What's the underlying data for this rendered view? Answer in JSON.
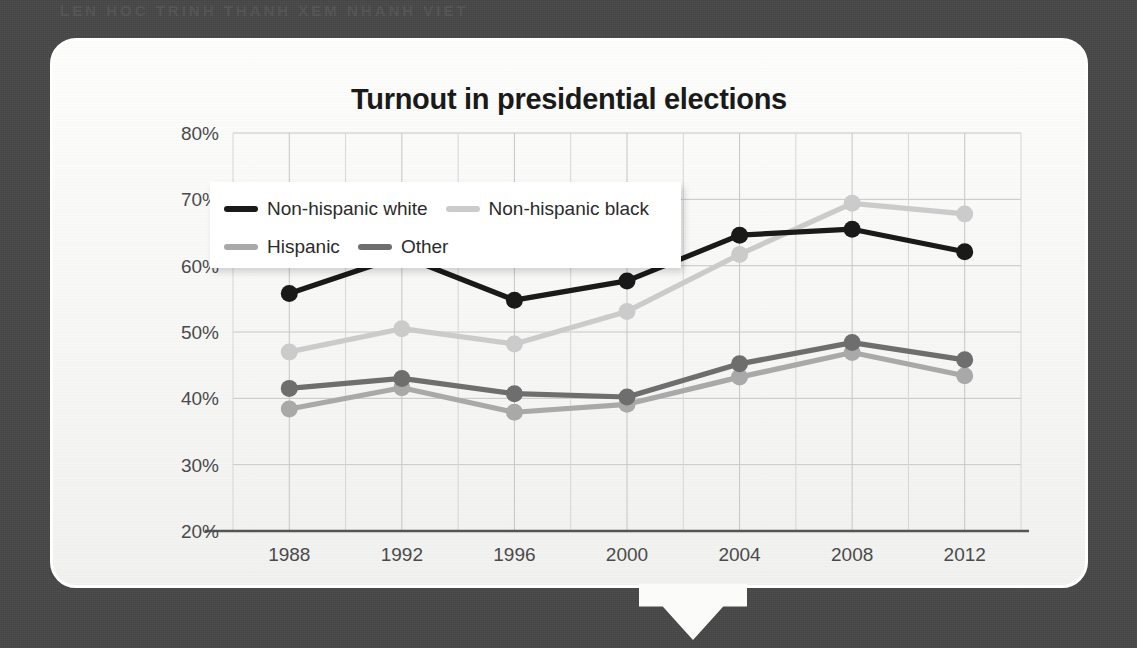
{
  "backdrop": {
    "ghost_text_top": "LEN HOC TRINH THANH  XEM NHANH  VIET",
    "ghost_text_bottom": "THONG KE CU TRI",
    "color": "#474747"
  },
  "panel": {
    "background": "#fbfbfa",
    "border_color": "#ffffff",
    "arrow_name": "callout-arrow"
  },
  "chart_data": {
    "type": "line",
    "title": "Turnout in presidential elections",
    "xlabel": "",
    "ylabel": "",
    "x": [
      1988,
      1992,
      1996,
      2000,
      2004,
      2008,
      2012
    ],
    "categories": [
      "1988",
      "1992",
      "1996",
      "2000",
      "2004",
      "2008",
      "2012"
    ],
    "ylim": [
      20,
      80
    ],
    "ytick_labels": [
      "20%",
      "30%",
      "40%",
      "50%",
      "60%",
      "70%",
      "80%"
    ],
    "ytick_values": [
      20,
      30,
      40,
      50,
      60,
      70,
      80
    ],
    "grid": true,
    "legend_position": "upper-left-inside",
    "series": [
      {
        "name": "Non-hispanic white",
        "color": "#1a1a1a",
        "values": [
          55.8,
          61.5,
          54.8,
          57.7,
          64.6,
          65.5,
          62.1
        ]
      },
      {
        "name": "Non-hispanic black",
        "color": "#cbcbcb",
        "values": [
          47.0,
          50.5,
          48.2,
          53.1,
          61.7,
          69.4,
          67.8
        ]
      },
      {
        "name": "Hispanic",
        "color": "#a9a9a9",
        "values": [
          38.4,
          41.6,
          37.9,
          39.1,
          43.2,
          46.9,
          43.4
        ]
      },
      {
        "name": "Other",
        "color": "#6e6e6e",
        "values": [
          41.5,
          43.0,
          40.7,
          40.2,
          45.2,
          48.4,
          45.8
        ]
      }
    ]
  }
}
